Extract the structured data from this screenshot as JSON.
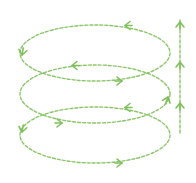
{
  "diagram": {
    "type": "spiral-helix",
    "colors": {
      "stroke": "#8cc66a",
      "arrow": "#7fbf5c",
      "background": "#ffffff"
    },
    "loops": [
      {
        "id": "top",
        "cx": 95,
        "cy": 53,
        "rx": 75,
        "ry": 28
      },
      {
        "id": "middle",
        "cx": 95,
        "cy": 94,
        "rx": 75,
        "ry": 29
      },
      {
        "id": "bottom",
        "cx": 95,
        "cy": 135,
        "rx": 75,
        "ry": 28
      }
    ],
    "vertical_arrow": {
      "x": 180,
      "y_top": 20,
      "y_bottom": 135,
      "arrowheads_y": [
        22,
        62,
        103
      ],
      "direction": "up"
    }
  }
}
